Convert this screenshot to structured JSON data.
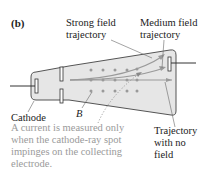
{
  "panel_label": "(b)",
  "labels": {
    "strong_field": [
      "Strong field",
      "trajectory"
    ],
    "medium_field": [
      "Medium field",
      "trajectory"
    ],
    "cathode": "Cathode",
    "b_field": "B",
    "no_field": [
      "Trajectory",
      "with no",
      "field"
    ]
  },
  "caption": "A current is measured only when the cathode-ray spot impinges on the collecting electrode.",
  "colors": {
    "tube_fill": "#e6e6e6",
    "tube_stroke": "#555555",
    "dot": "#9a9a9a",
    "arrow": "#9a9a9a",
    "caption": "#9a9a9a",
    "text": "#222222"
  }
}
